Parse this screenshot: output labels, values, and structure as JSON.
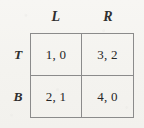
{
  "figure": {
    "kind": "payoff-matrix",
    "colors": {
      "background": "#f6f5f2",
      "border": "#8b8b8b",
      "text": "#2b2b2b"
    }
  },
  "column_headers": [
    {
      "key": "L",
      "label": "L"
    },
    {
      "key": "R",
      "label": "R"
    }
  ],
  "row_headers": [
    {
      "key": "T",
      "label": "T"
    },
    {
      "key": "B",
      "label": "B"
    }
  ],
  "cells": [
    [
      {
        "label": "1, 0",
        "row_payoff": 1,
        "col_payoff": 0
      },
      {
        "label": "3, 2",
        "row_payoff": 3,
        "col_payoff": 2
      }
    ],
    [
      {
        "label": "2, 1",
        "row_payoff": 2,
        "col_payoff": 1
      },
      {
        "label": "4, 0",
        "row_payoff": 4,
        "col_payoff": 0
      }
    ]
  ]
}
